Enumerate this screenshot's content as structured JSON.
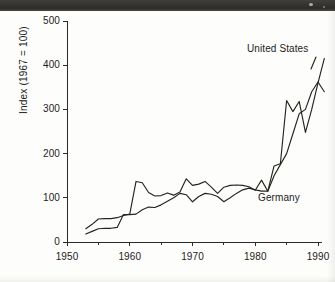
{
  "figure": {
    "background_color": "#fdfdfb",
    "ink_color": "#26241f",
    "scan_band_color": "#36342f"
  },
  "axes": {
    "y_title": "Index (1967 = 100)",
    "y_ticks": [
      "0",
      "100",
      "200",
      "300",
      "400",
      "500"
    ],
    "x_ticks": [
      "1950",
      "1960",
      "1970",
      "1980",
      "1990"
    ]
  },
  "annotations": {
    "united_states": "United States",
    "germany": "Germany"
  },
  "chart_data": {
    "type": "line",
    "title": "",
    "xlabel": "",
    "ylabel": "Index (1967 = 100)",
    "xlim": [
      1950,
      1991
    ],
    "ylim": [
      0,
      500
    ],
    "xticks": [
      1950,
      1960,
      1970,
      1980,
      1990
    ],
    "xticks_minor": [
      1955,
      1965,
      1975,
      1985
    ],
    "yticks": [
      0,
      100,
      200,
      300,
      400,
      500
    ],
    "grid": false,
    "legend": "inline-annotations",
    "series": [
      {
        "name": "United States",
        "label_position": "upper-right",
        "x": [
          1953,
          1954,
          1955,
          1956,
          1957,
          1958,
          1959,
          1960,
          1961,
          1962,
          1963,
          1964,
          1965,
          1966,
          1967,
          1968,
          1969,
          1970,
          1971,
          1972,
          1973,
          1974,
          1975,
          1976,
          1977,
          1978,
          1979,
          1980,
          1981,
          1982,
          1983,
          1984,
          1985,
          1986,
          1987,
          1988,
          1989,
          1990,
          1991
        ],
        "values": [
          30,
          40,
          52,
          53,
          53,
          55,
          60,
          63,
          137,
          134,
          112,
          104,
          105,
          111,
          106,
          113,
          143,
          128,
          131,
          137,
          124,
          110,
          124,
          128,
          129,
          128,
          125,
          117,
          140,
          115,
          172,
          177,
          320,
          295,
          318,
          248,
          300,
          360,
          415
        ]
      },
      {
        "name": "Germany",
        "label_position": "lower-right",
        "x": [
          1953,
          1954,
          1955,
          1956,
          1957,
          1958,
          1959,
          1960,
          1961,
          1962,
          1963,
          1964,
          1965,
          1966,
          1967,
          1968,
          1969,
          1970,
          1971,
          1972,
          1973,
          1974,
          1975,
          1976,
          1977,
          1978,
          1979,
          1980,
          1981,
          1982,
          1983,
          1984,
          1985,
          1986,
          1987,
          1988,
          1989,
          1990,
          1991
        ],
        "values": [
          18,
          24,
          30,
          31,
          31,
          33,
          62,
          62,
          63,
          73,
          79,
          78,
          84,
          92,
          100,
          110,
          107,
          91,
          103,
          110,
          108,
          103,
          91,
          100,
          110,
          118,
          122,
          118,
          115,
          115,
          150,
          175,
          200,
          245,
          290,
          300,
          340,
          362,
          340
        ]
      }
    ]
  }
}
